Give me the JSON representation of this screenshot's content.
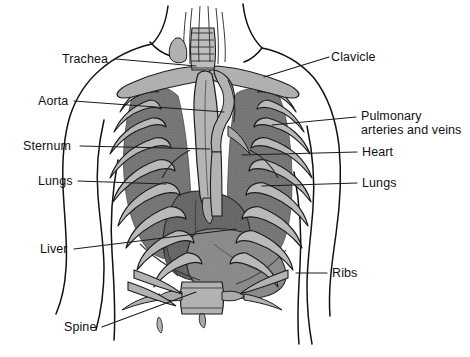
{
  "figure": {
    "background_color": "#ffffff",
    "outline_color": "#111111",
    "colors": {
      "bone_light": "#b9b9b9",
      "bone_mid": "#a2a2a2",
      "tissue_dark": "#7b7b7b",
      "heart_dark": "#6d6d6d",
      "liver_mid": "#8e8e8e",
      "outline": "#111111",
      "leader_line": "#2a2a2a"
    }
  },
  "labels": {
    "left": [
      {
        "id": "trachea",
        "text": "Trachea",
        "x": 62,
        "y": 53
      },
      {
        "id": "aorta",
        "text": "Aorta",
        "x": 38,
        "y": 95
      },
      {
        "id": "sternum",
        "text": "Sternum",
        "x": 23,
        "y": 140
      },
      {
        "id": "lungs_l",
        "text": "Lungs",
        "x": 38,
        "y": 175
      },
      {
        "id": "liver",
        "text": "Liver",
        "x": 40,
        "y": 243
      },
      {
        "id": "spine",
        "text": "Spine",
        "x": 64,
        "y": 321
      }
    ],
    "right": [
      {
        "id": "clavicle",
        "text": "Clavicle",
        "x": 331,
        "y": 51
      },
      {
        "id": "pulmonary",
        "text": "Pulmonary",
        "text2": "arteries and veins",
        "x": 361,
        "y": 110
      },
      {
        "id": "heart",
        "text": "Heart",
        "x": 362,
        "y": 146
      },
      {
        "id": "lungs_r",
        "text": "Lungs",
        "x": 362,
        "y": 177
      },
      {
        "id": "ribs",
        "text": "Ribs",
        "x": 332,
        "y": 267
      }
    ]
  },
  "structures": [
    {
      "id": "trachea",
      "name": "Trachea"
    },
    {
      "id": "aorta",
      "name": "Aorta"
    },
    {
      "id": "sternum",
      "name": "Sternum"
    },
    {
      "id": "lungs",
      "name": "Lungs"
    },
    {
      "id": "liver",
      "name": "Liver"
    },
    {
      "id": "spine",
      "name": "Spine"
    },
    {
      "id": "clavicle",
      "name": "Clavicle"
    },
    {
      "id": "pulmonary",
      "name": "Pulmonary arteries and veins"
    },
    {
      "id": "heart",
      "name": "Heart"
    },
    {
      "id": "ribs",
      "name": "Ribs"
    }
  ]
}
